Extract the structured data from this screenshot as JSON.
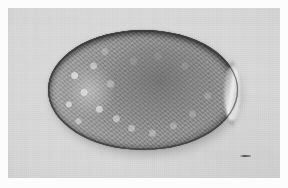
{
  "image": {
    "kind": "photomicrograph",
    "subject": "parasite-egg",
    "modality": "brightfield-light-microscopy",
    "color_mode": "grayscale",
    "caption": "",
    "width_px": 288,
    "height_px": 188
  },
  "border": {
    "present": true,
    "color": "#fcfcfc",
    "thickness_px": 8
  },
  "field": {
    "background_color": "#d9d9d9",
    "background_color_dark": "#cfcfcf",
    "left_px": 8,
    "top_px": 8,
    "width_px": 272,
    "height_px": 170
  },
  "specimen": {
    "name": "ovum",
    "shape": "ellipsoid",
    "center_x_px": 143,
    "center_y_px": 90,
    "width_px": 190,
    "height_px": 120,
    "shell_color": "#4a4a4a",
    "body_color": "#8d8d8d",
    "interior_color": "#9a9a9a",
    "highlight_color": "#fcfcfc",
    "features": [
      "dark-shell-rim",
      "granular-cytoplasm",
      "bright-opercular-highlight-right-pole",
      "pale-left-shoulder",
      "darker-central-mass"
    ]
  },
  "artifact": {
    "name": "scale-mark",
    "x_px": 240,
    "y_px": 155,
    "width_px": 11,
    "height_px": 2,
    "color": "#373737"
  }
}
